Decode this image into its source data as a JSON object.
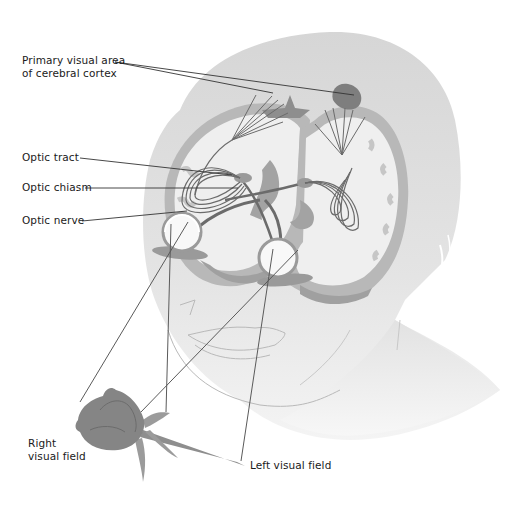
{
  "figure": {
    "colors": {
      "head_fill": "#d9d9d9",
      "head_light": "#e8e8e8",
      "brain_fill": "#eeeeee",
      "cortex_band": "#c4c4c4",
      "deep_brain": "#a9a9a9",
      "pathway_stroke": "#6b6b6b",
      "leader_line": "#333333",
      "rose_fill": "#8a8a8a",
      "text": "#1a1a1a"
    }
  },
  "labels": {
    "primary_visual_area": {
      "line1": "Primary visual area",
      "line2": "of cerebral cortex"
    },
    "optic_tract": "Optic tract",
    "optic_chiasm": "Optic chiasm",
    "optic_nerve": "Optic nerve",
    "right_visual_field": {
      "line1": "Right",
      "line2": "visual field"
    },
    "left_visual_field": "Left visual field"
  }
}
